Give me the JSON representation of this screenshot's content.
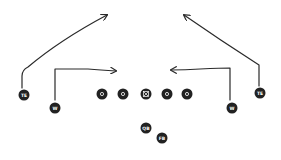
{
  "diagram": {
    "type": "football-play",
    "colors": {
      "background": "#ffffff",
      "player_fill": "#222222",
      "label": "#ffffff",
      "route_stroke": "#2a2a2a"
    },
    "players": [
      {
        "id": "te-left",
        "label": "TE",
        "x": 24,
        "y": 95
      },
      {
        "id": "w-left",
        "label": "W",
        "x": 55,
        "y": 108
      },
      {
        "id": "ol-1",
        "label": "O",
        "x": 102,
        "y": 94
      },
      {
        "id": "ol-2",
        "label": "O",
        "x": 123,
        "y": 94
      },
      {
        "id": "center",
        "label": "⊠",
        "x": 146,
        "y": 94
      },
      {
        "id": "ol-4",
        "label": "O",
        "x": 167,
        "y": 94
      },
      {
        "id": "ol-5",
        "label": "O",
        "x": 187,
        "y": 94
      },
      {
        "id": "w-right",
        "label": "W",
        "x": 232,
        "y": 108
      },
      {
        "id": "te-right",
        "label": "TE",
        "x": 260,
        "y": 93
      },
      {
        "id": "qb",
        "label": "QB",
        "x": 146,
        "y": 128
      },
      {
        "id": "fb",
        "label": "FB",
        "x": 162,
        "y": 138
      }
    ],
    "routes": [
      {
        "id": "route-te-left",
        "player": "TE",
        "description": "vertical then diagonal to upper right"
      },
      {
        "id": "route-w-left",
        "player": "W",
        "description": "vertical then in-cut right"
      },
      {
        "id": "route-w-right",
        "player": "W",
        "description": "vertical then in-cut left"
      },
      {
        "id": "route-te-right",
        "player": "TE",
        "description": "vertical then diagonal to upper left"
      }
    ]
  }
}
